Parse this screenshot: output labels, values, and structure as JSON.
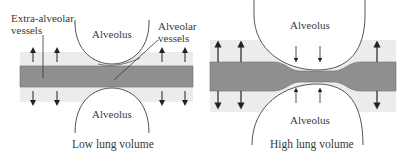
{
  "diagram": {
    "colors": {
      "vessel": "#8f8f8f",
      "vessel_edge": "#6e6e6e",
      "tissue": "#ececec",
      "alveolus_stroke": "#555555",
      "arrow": "#222222",
      "text": "#3a3a3a"
    },
    "left_panel": {
      "caption": "Low lung volume",
      "alveolus_top_label": "Alveolus",
      "alveolus_bottom_label": "Alveolus",
      "extra_alveolar_label_line1": "Extra-alveolar",
      "extra_alveolar_label_line2": "vessels",
      "alveolar_label_line1": "Alveolar",
      "alveolar_label_line2": "vessels"
    },
    "right_panel": {
      "caption": "High lung volume",
      "alveolus_top_label": "Alveolus",
      "alveolus_bottom_label": "Alveolus"
    }
  }
}
